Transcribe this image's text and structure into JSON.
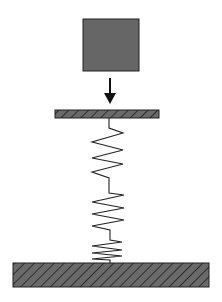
{
  "diagram": {
    "colors": {
      "background": "#ffffff",
      "mass_fill": "#666666",
      "stroke": "#222222",
      "hatch_fill": "#6a6a6a",
      "hatch_line": "#1e1e1e"
    },
    "mass": {
      "label": "block",
      "x": 83,
      "y": 19,
      "width": 56,
      "height": 52
    },
    "arrow": {
      "label": "down-arrow",
      "x": 110,
      "y1": 78,
      "y2": 104
    },
    "plate": {
      "label": "top-plate",
      "x": 55,
      "y": 110,
      "width": 104,
      "height": 8
    },
    "spring": {
      "label": "spring",
      "points": "109,118 109,128 123,133 92,142 123,150 92,158 123,164 92,172 109,178 109,193 124,195 92,202 124,208 92,214 124,220 92,226 110,230 110,240 122,242 92,246 122,250 92,253 122,256 92,259 110,260 110,264"
    },
    "ground": {
      "label": "ground",
      "x": 13,
      "y": 263,
      "width": 196,
      "height": 24
    }
  }
}
